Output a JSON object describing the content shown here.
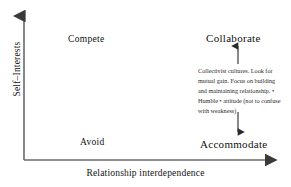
{
  "diagram": {
    "axes": {
      "x_label": "Relationship interdependence",
      "y_label": "Self–Interests",
      "x_arrow_icon": "arrow-right-icon",
      "y_arrow_icon": "arrow-up-icon",
      "line_color": "#555555"
    },
    "quadrants": [
      {
        "id": "compete",
        "label": "Compete"
      },
      {
        "id": "collaborate",
        "label": "Collaborate"
      },
      {
        "id": "avoid",
        "label": "Avoid"
      },
      {
        "id": "accommodate",
        "label": "Accommodate"
      }
    ],
    "annotation": {
      "text": "Collectivist cultures. Look for mutual gain. Focus on building and maintaining relationship. • Humble • attitude (not to confuse with weakness)",
      "connector_up_icon": "arrow-up-icon",
      "connector_down_icon": "arrow-down-icon"
    }
  }
}
